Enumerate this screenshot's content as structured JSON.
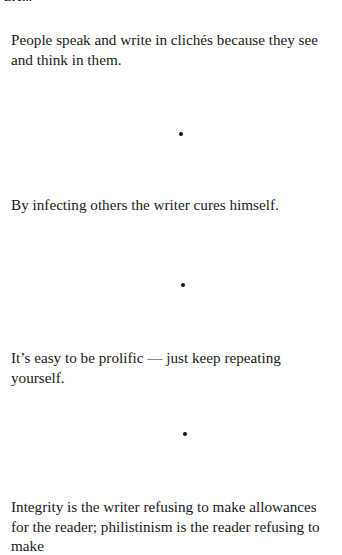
{
  "page": {
    "cutoff_header": "Ere...",
    "paragraphs": [
      "People speak and write in clichés because they see and think in them.",
      "By infecting others the writer cures himself.",
      "It’s easy to be prolific — just keep repeating yourself.",
      "Integrity is the writer refusing to make allowances for the reader; philistinism is the reader refusing to make"
    ],
    "separator": "bullet-dot"
  }
}
